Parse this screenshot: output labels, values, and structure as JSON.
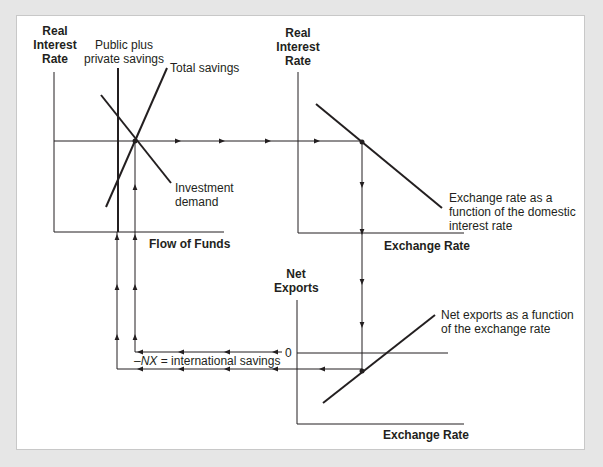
{
  "diagram": {
    "top_left": {
      "y_axis_label": [
        "Real",
        "Interest",
        "Rate"
      ],
      "x_axis_label": "Flow of Funds",
      "curves": {
        "public_private": [
          "Public plus",
          "private savings"
        ],
        "total_savings": "Total savings",
        "investment": [
          "Investment",
          "demand"
        ]
      }
    },
    "top_right": {
      "y_axis_label": [
        "Real",
        "Interest",
        "Rate"
      ],
      "x_axis_label": "Exchange Rate",
      "curve": [
        "Exchange rate as a",
        "function of the domestic",
        "interest rate"
      ]
    },
    "bottom_right": {
      "y_axis_label": [
        "Net",
        "Exports"
      ],
      "x_axis_label": "Exchange Rate",
      "zero_label": "0",
      "curve": [
        "Net exports as a function",
        "of the exchange rate"
      ]
    },
    "flow_label_prefix": "–",
    "flow_label_var": "NX",
    "flow_label_suffix": " = international savings",
    "colors": {
      "line": "#231f20",
      "background": "#e6e6e6",
      "panel": "#ffffff"
    }
  }
}
